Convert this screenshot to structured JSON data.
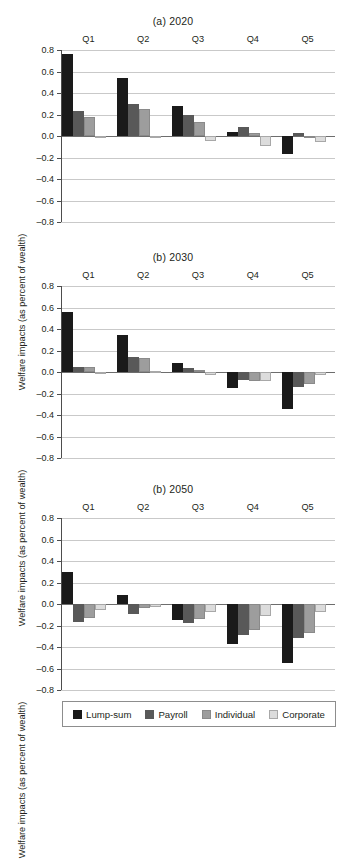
{
  "chart_data": {
    "type": "bar",
    "ylabel": "Welfare impacts (as percent of wealth)",
    "xlabel": "",
    "ylim": [
      -0.8,
      0.8
    ],
    "yticks": [
      0.8,
      0.6,
      0.4,
      0.2,
      0.0,
      -0.2,
      -0.4,
      -0.6,
      -0.8
    ],
    "ytick_labels": [
      "0.8",
      "0.6",
      "0.4",
      "0.2",
      "0.0",
      "–0.2",
      "–0.4",
      "–0.6",
      "–0.8"
    ],
    "grid": true,
    "legend_position": "bottom",
    "categories": [
      "Q1",
      "Q2",
      "Q3",
      "Q4",
      "Q5"
    ],
    "legend": [
      "Lump-sum",
      "Payroll",
      "Individual",
      "Corporate"
    ],
    "colors": [
      "#1a1a1a",
      "#595959",
      "#9d9d9d",
      "#dcdcdc"
    ],
    "panels": [
      {
        "title": "(a) 2020",
        "series": [
          {
            "name": "Lump-sum",
            "values": [
              0.76,
              0.54,
              0.28,
              0.04,
              -0.17
            ]
          },
          {
            "name": "Payroll",
            "values": [
              0.23,
              0.3,
              0.2,
              0.08,
              0.03
            ]
          },
          {
            "name": "Individual",
            "values": [
              0.18,
              0.25,
              0.13,
              0.03,
              0.0
            ]
          },
          {
            "name": "Corporate",
            "values": [
              -0.02,
              -0.01,
              -0.05,
              -0.09,
              -0.06
            ]
          }
        ]
      },
      {
        "title": "(b) 2030",
        "series": [
          {
            "name": "Lump-sum",
            "values": [
              0.56,
              0.34,
              0.08,
              -0.15,
              -0.34
            ]
          },
          {
            "name": "Payroll",
            "values": [
              0.05,
              0.14,
              0.04,
              -0.07,
              -0.14
            ]
          },
          {
            "name": "Individual",
            "values": [
              0.05,
              0.13,
              0.02,
              -0.08,
              -0.11
            ]
          },
          {
            "name": "Corporate",
            "values": [
              -0.015,
              0.01,
              -0.03,
              -0.08,
              -0.03
            ]
          }
        ]
      },
      {
        "title": "(b) 2050",
        "series": [
          {
            "name": "Lump-sum",
            "values": [
              0.3,
              0.08,
              -0.15,
              -0.37,
              -0.55
            ]
          },
          {
            "name": "Payroll",
            "values": [
              -0.17,
              -0.09,
              -0.18,
              -0.29,
              -0.32
            ]
          },
          {
            "name": "Individual",
            "values": [
              -0.13,
              -0.04,
              -0.14,
              -0.24,
              -0.27
            ]
          },
          {
            "name": "Corporate",
            "values": [
              -0.06,
              -0.025,
              -0.07,
              -0.11,
              -0.07
            ]
          }
        ]
      }
    ]
  }
}
